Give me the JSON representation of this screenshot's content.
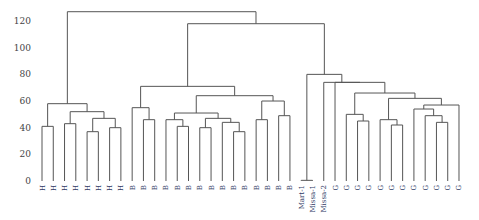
{
  "chart_data": {
    "type": "dendrogram",
    "title": "",
    "xlabel": "",
    "ylabel": "",
    "ylim": [
      0,
      130
    ],
    "yticks": [
      0,
      20,
      40,
      60,
      80,
      100,
      120
    ],
    "grid": false,
    "legend": null,
    "leaves": [
      "H",
      "H",
      "H",
      "H",
      "H",
      "H",
      "H",
      "H",
      "B",
      "B",
      "B",
      "B",
      "B",
      "B",
      "B",
      "B",
      "B",
      "B",
      "B",
      "B",
      "B",
      "B",
      "B",
      "Mart-1",
      "Missa-1",
      "Missa-2",
      "G",
      "G",
      "G",
      "G",
      "G",
      "G",
      "G",
      "G",
      "G",
      "G",
      "G",
      "G"
    ],
    "merges": [
      {
        "a": "L0",
        "b": "L1",
        "h": 41,
        "id": "H01"
      },
      {
        "a": "L2",
        "b": "L3",
        "h": 43,
        "id": "H23"
      },
      {
        "a": "L4",
        "b": "L5",
        "h": 37,
        "id": "H45"
      },
      {
        "a": "L6",
        "b": "L7",
        "h": 40,
        "id": "H67"
      },
      {
        "a": "H45",
        "b": "H67",
        "h": 47,
        "id": "H4567"
      },
      {
        "a": "H23",
        "b": "H4567",
        "h": 52,
        "id": "H2_7"
      },
      {
        "a": "H01",
        "b": "H2_7",
        "h": 58,
        "id": "Hall"
      },
      {
        "a": "L9",
        "b": "L10",
        "h": 46,
        "id": "B9_10"
      },
      {
        "a": "L8",
        "b": "B9_10",
        "h": 55,
        "id": "B8_10"
      },
      {
        "a": "L12",
        "b": "L13",
        "h": 41,
        "id": "B12_13"
      },
      {
        "a": "L11",
        "b": "B12_13",
        "h": 46,
        "id": "B11_13"
      },
      {
        "a": "L14",
        "b": "L15",
        "h": 40,
        "id": "B14_15"
      },
      {
        "a": "L17",
        "b": "L18",
        "h": 37,
        "id": "B17_18"
      },
      {
        "a": "L16",
        "b": "B17_18",
        "h": 44,
        "id": "B16_18"
      },
      {
        "a": "B14_15",
        "b": "B16_18",
        "h": 47,
        "id": "B14_18"
      },
      {
        "a": "B11_13",
        "b": "B14_18",
        "h": 51,
        "id": "B11_18"
      },
      {
        "a": "L19",
        "b": "L20",
        "h": 46,
        "id": "B19_20"
      },
      {
        "a": "L21",
        "b": "L22",
        "h": 49,
        "id": "B21_22"
      },
      {
        "a": "B19_20",
        "b": "B21_22",
        "h": 60,
        "id": "B19_22"
      },
      {
        "a": "B11_18",
        "b": "B19_22",
        "h": 64,
        "id": "B11_22"
      },
      {
        "a": "B8_10",
        "b": "B11_22",
        "h": 71,
        "id": "Ball"
      },
      {
        "a": "L28",
        "b": "L29",
        "h": 45,
        "id": "G28_29"
      },
      {
        "a": "L27",
        "b": "G28_29",
        "h": 50,
        "id": "G27_29"
      },
      {
        "a": "L31",
        "b": "L32",
        "h": 42,
        "id": "G31_32"
      },
      {
        "a": "L30",
        "b": "G31_32",
        "h": 46,
        "id": "G30_32"
      },
      {
        "a": "L35",
        "b": "L36",
        "h": 44,
        "id": "G35_36"
      },
      {
        "a": "L34",
        "b": "G35_36",
        "h": 49,
        "id": "G34_36"
      },
      {
        "a": "L33",
        "b": "G34_36",
        "h": 54,
        "id": "G33_36"
      },
      {
        "a": "L37",
        "b": "G33_36",
        "h": 57,
        "id": "G33_37"
      },
      {
        "a": "G30_32",
        "b": "G33_37",
        "h": 62,
        "id": "G30_37"
      },
      {
        "a": "G27_29",
        "b": "G30_37",
        "h": 66,
        "id": "G27_37"
      },
      {
        "a": "L26",
        "b": "G27_37",
        "h": 74,
        "id": "Gall"
      },
      {
        "a": "L25",
        "b": "Gall",
        "h": 54,
        "id": "_unused"
      }
    ]
  },
  "axis": {
    "tick_labels": [
      "0",
      "20",
      "40",
      "60",
      "80",
      "100",
      "120"
    ]
  }
}
